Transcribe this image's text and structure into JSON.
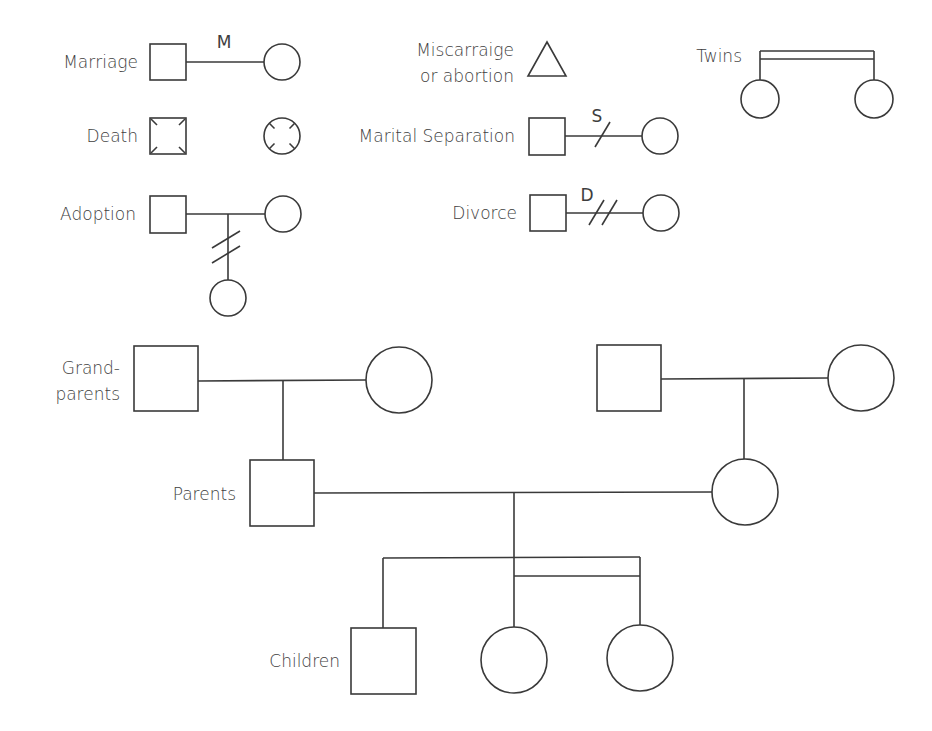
{
  "legend": {
    "marriage": {
      "label": "Marriage",
      "line_letter": "M"
    },
    "death": {
      "label": "Death"
    },
    "adoption": {
      "label": "Adoption"
    },
    "miscarriage": {
      "label_line1": "Miscarraige",
      "label_line2": "or abortion"
    },
    "separation": {
      "label": "Marital Separation",
      "line_letter": "S"
    },
    "divorce": {
      "label": "Divorce",
      "line_letter": "D"
    },
    "twins": {
      "label": "Twins"
    }
  },
  "tree": {
    "generations": [
      {
        "label_line1": "Grand-",
        "label_line2": "parents"
      },
      {
        "label": "Parents"
      },
      {
        "label": "Children"
      }
    ]
  },
  "colors": {
    "stroke": "#3a3a3a",
    "text": "#3e3e3e",
    "background": "#ffffff"
  }
}
